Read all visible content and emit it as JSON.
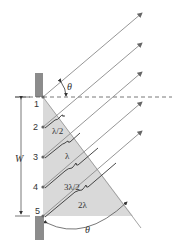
{
  "diagram": {
    "slit_points": [
      "1",
      "2",
      "3",
      "4",
      "5"
    ],
    "path_differences": [
      "λ/2",
      "λ",
      "3λ/2",
      "2λ"
    ],
    "width_label": "W",
    "angle_label_top": "θ",
    "angle_label_bottom": "θ",
    "colors": {
      "wall": "#8c8c8c",
      "shade": "#d9d9d9",
      "ray": "#8a8a8a",
      "text": "#333333"
    }
  }
}
